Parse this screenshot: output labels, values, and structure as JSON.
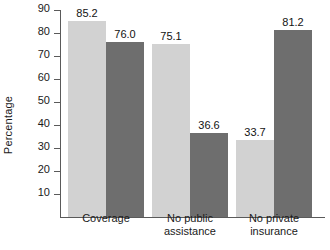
{
  "chart_data": {
    "type": "bar",
    "title": "",
    "xlabel": "",
    "ylabel": "Percentage",
    "categories": [
      "Coverage",
      "No public\nassistance",
      "No private\ninsurance"
    ],
    "series": [
      {
        "name": "series-light",
        "color": "#d2d2d2",
        "values": [
          85.2,
          75.1,
          33.7
        ]
      },
      {
        "name": "series-dark",
        "color": "#6e6e6e",
        "values": [
          76.0,
          36.6,
          81.2
        ]
      }
    ],
    "value_labels": [
      [
        "85.2",
        "76.0"
      ],
      [
        "75.1",
        "36.6"
      ],
      [
        "33.7",
        "81.2"
      ]
    ],
    "ylim": [
      0,
      90
    ],
    "yticks": [
      10,
      20,
      30,
      40,
      50,
      60,
      70,
      80,
      90
    ],
    "ytick_labels": [
      "10",
      "20",
      "30",
      "40",
      "50",
      "60",
      "70",
      "80",
      "90"
    ],
    "grid": false,
    "legend": "none"
  }
}
